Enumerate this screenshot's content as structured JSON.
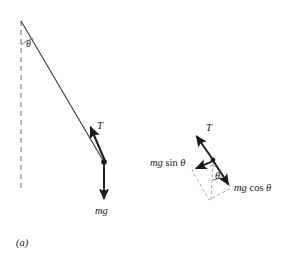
{
  "figure": {
    "caption": "(a)",
    "background_color": "#ffffff",
    "ink_color": "#1a1a1a",
    "dashed_color": "#9a9a9a"
  },
  "pendulum_diagram": {
    "name": "simple-pendulum-with-forces",
    "pivot": {
      "x": 21,
      "y": 21
    },
    "bob": {
      "x": 104,
      "y": 162
    },
    "vertical_dashed_line": {
      "x": 21,
      "y_start": 21,
      "y_end": 190
    },
    "string": {
      "x1": 21,
      "y1": 21,
      "x2": 104,
      "y2": 162
    },
    "angle_arc_label": "θ",
    "angle_label_position": {
      "x": 27,
      "y": 44
    },
    "tension_vector": {
      "label": "T",
      "tail": {
        "x": 104,
        "y": 162
      },
      "tip": {
        "x": 88,
        "y": 124
      },
      "label_position": {
        "x": 98,
        "y": 122
      }
    },
    "weight_vector": {
      "label": "mg",
      "tail": {
        "x": 104,
        "y": 162
      },
      "tip": {
        "x": 104,
        "y": 203
      },
      "label_position": {
        "x": 95,
        "y": 207
      }
    }
  },
  "force_resolution_diagram": {
    "name": "weight-components-parallelogram",
    "vertex": {
      "x": 213,
      "y": 160
    },
    "tension_vector": {
      "label": "T",
      "tail": {
        "x": 213,
        "y": 160
      },
      "tip": {
        "x": 194,
        "y": 132
      },
      "label_position": {
        "x": 206,
        "y": 124
      }
    },
    "resultant_weight_vector": {
      "label": "mg cos θ",
      "tail": {
        "x": 213,
        "y": 160
      },
      "tip": {
        "x": 231,
        "y": 188
      },
      "label_position": {
        "x": 234,
        "y": 184
      }
    },
    "tangential_component_vector": {
      "label": "mg sin θ",
      "tail": {
        "x": 213,
        "y": 160
      },
      "tip": {
        "x": 192,
        "y": 170
      },
      "label_position": {
        "x": 150,
        "y": 158
      }
    },
    "parallelogram_dashed": [
      {
        "x": 213,
        "y": 160
      },
      {
        "x": 192,
        "y": 170
      },
      {
        "x": 209,
        "y": 200
      },
      {
        "x": 231,
        "y": 188
      }
    ],
    "vertical_dashed_guide": {
      "x": 213,
      "y_start": 162,
      "y_end": 200
    },
    "angle_arc_label": "θ",
    "angle_label_position": {
      "x": 216,
      "y": 172
    }
  },
  "labels": {
    "theta": "θ",
    "tension": "T",
    "weight": "mg",
    "mg_sin_theta_prefix": "mg",
    "mg_sin_theta_func": "sin",
    "mg_cos_theta_prefix": "mg",
    "mg_cos_theta_func": "cos"
  }
}
